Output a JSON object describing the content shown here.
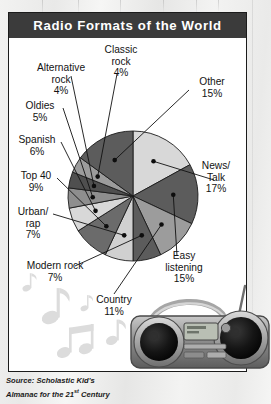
{
  "panel": {
    "title": "Radio Formats of the World"
  },
  "source": {
    "line1": "Source: Scholastic Kid's",
    "line2_pre": "Almanac for the 21",
    "line2_sup": "st",
    "line2_post": " Century"
  },
  "decor": {
    "music_notes_icon": "music-note-icon",
    "boombox_icon": "boombox-icon",
    "backdrop_icon": "photo-backdrop"
  },
  "labels": [
    {
      "name": "classic-rock",
      "text": "Classic\nrock\n4%"
    },
    {
      "name": "alternative-rock",
      "text": "Alternative\nrock\n4%"
    },
    {
      "name": "oldies",
      "text": "Oldies\n5%"
    },
    {
      "name": "spanish",
      "text": "Spanish\n6%"
    },
    {
      "name": "top-40",
      "text": "Top 40\n9%"
    },
    {
      "name": "urban-rap",
      "text": "Urban/\nrap\n7%"
    },
    {
      "name": "modern-rock",
      "text": "Modern rock\n7%"
    },
    {
      "name": "country",
      "text": "Country\n11%"
    },
    {
      "name": "easy-listening",
      "text": "Easy\nlistening\n15%"
    },
    {
      "name": "news-talk",
      "text": "News/\nTalk\n17%"
    },
    {
      "name": "other",
      "text": "Other\n15%"
    }
  ],
  "chart_data": {
    "type": "pie",
    "title": "Radio Formats of the World",
    "subtitle": "",
    "xlabel": "",
    "ylabel": "",
    "units": "percent",
    "total": 100,
    "legend_position": "none",
    "labels_position": "outside-with-leader-lines",
    "grid": false,
    "categories": [
      "News/Talk",
      "Easy listening",
      "Country",
      "Modern rock",
      "Urban/rap",
      "Top 40",
      "Spanish",
      "Oldies",
      "Alternative rock",
      "Classic rock",
      "Other"
    ],
    "values": [
      17,
      15,
      11,
      7,
      7,
      9,
      6,
      5,
      4,
      4,
      15
    ],
    "slice_colors": [
      "#d8d8d8",
      "#5c5c5c",
      "#9c9c9c",
      "#5c5c5c",
      "#d0d0d0",
      "#6b6b6b",
      "#d8d8d8",
      "#8e8e8e",
      "#4f4f4f",
      "#9c9c9c",
      "#5c5c5c"
    ],
    "start_angle_deg": -90,
    "direction": "clockwise",
    "source": "Scholastic Kid's Almanac for the 21st Century"
  }
}
